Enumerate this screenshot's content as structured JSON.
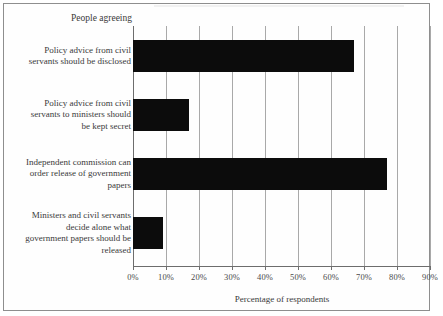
{
  "chart_data": {
    "type": "bar",
    "orientation": "horizontal",
    "title": "",
    "legend_label": "People agreeing",
    "xlabel": "Percentage of respondents",
    "ylabel": "",
    "xlim": [
      0,
      90
    ],
    "xticks": [
      0,
      10,
      20,
      30,
      40,
      50,
      60,
      70,
      80,
      90
    ],
    "xtick_labels": [
      "0%",
      "10%",
      "20%",
      "30%",
      "40%",
      "50%",
      "60%",
      "70%",
      "80%",
      "90%"
    ],
    "grid": true,
    "grid_axis": "x",
    "legend_position": "top-left",
    "bar_color": "#0c0c0c",
    "categories": [
      "Policy advice from civil servants should be disclosed",
      "Policy advice from civil servants to ministers should be kept secret",
      "Independent commission can order release of government papers",
      "Ministers and civil servants decide alone what government papers should be released"
    ],
    "values": [
      67,
      17,
      77,
      9
    ],
    "series": [
      {
        "name": "People agreeing",
        "values": [
          67,
          17,
          77,
          9
        ]
      }
    ]
  },
  "category_lines": [
    [
      "Policy advice from civil",
      "servants should be disclosed"
    ],
    [
      "Policy advice from civil",
      "servants to ministers should",
      "be kept secret"
    ],
    [
      "Independent commission can",
      "order release of government",
      "papers"
    ],
    [
      "Ministers and civil servants",
      "decide alone what",
      "government papers should be",
      "released"
    ]
  ]
}
